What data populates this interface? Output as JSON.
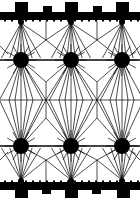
{
  "figure": {
    "type": "field-line diagram",
    "background": "#ffffff",
    "ink": "#000000",
    "caption": "·· ··",
    "top_bar": {
      "y": 12,
      "height": 8,
      "tall_blocks": [
        {
          "x": 15,
          "w": 13
        },
        {
          "x": 65,
          "w": 13
        },
        {
          "x": 116,
          "w": 13
        }
      ],
      "short_blocks": [
        {
          "x": 43,
          "w": 9
        },
        {
          "x": 93,
          "w": 9
        }
      ],
      "tall_top": 2,
      "short_top": 6
    },
    "bottom_bar": {
      "y": 182,
      "height": 8,
      "tall_blocks": [
        {
          "x": 15,
          "w": 13
        },
        {
          "x": 65,
          "w": 13
        },
        {
          "x": 117,
          "w": 13
        }
      ],
      "short_blocks": [
        {
          "x": 42,
          "w": 9
        },
        {
          "x": 92,
          "w": 9
        }
      ],
      "tall_bottom": 198,
      "short_bottom": 194
    },
    "dots": {
      "radius": 8,
      "upper_row_y": 60,
      "lower_row_y": 146,
      "x": [
        21,
        71,
        122
      ]
    },
    "midline_y": 100,
    "saddle_points": [
      {
        "x": 46,
        "y": 100
      },
      {
        "x": 97,
        "y": 100
      }
    ],
    "upper_nodes_y": 23,
    "lower_nodes_y": 180,
    "upper_junctions": [
      {
        "x": 46,
        "y": 40
      },
      {
        "x": 97,
        "y": 40
      }
    ],
    "lower_junctions": [
      {
        "x": 46,
        "y": 160
      },
      {
        "x": 97,
        "y": 160
      }
    ]
  }
}
